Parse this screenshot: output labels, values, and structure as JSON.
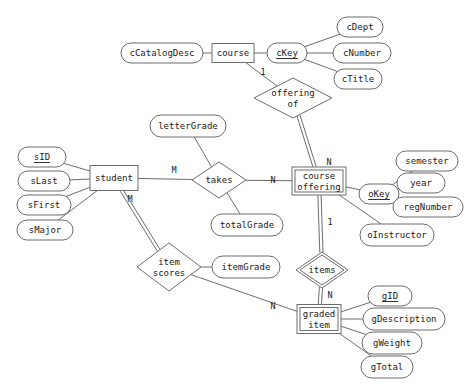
{
  "diagram": {
    "type": "entity-relationship-diagram",
    "background_color": "#ffffff",
    "line_color": "#6d6d6d",
    "text_color": "#1a1a1a"
  },
  "entities": [
    {
      "id": "course",
      "label": "course",
      "kind": "strong",
      "x": 233,
      "y": 53,
      "w": 42,
      "h": 19
    },
    {
      "id": "student",
      "label": "student",
      "kind": "strong",
      "x": 114,
      "y": 178,
      "w": 48,
      "h": 25
    },
    {
      "id": "course_offering",
      "label_line1": "course",
      "label_line2": "offering",
      "kind": "weak",
      "x": 319,
      "y": 181,
      "w": 54,
      "h": 28
    },
    {
      "id": "graded_item",
      "label_line1": "graded",
      "label_line2": "item",
      "kind": "weak",
      "x": 319,
      "y": 319,
      "w": 44,
      "h": 29
    }
  ],
  "relationships": [
    {
      "id": "offering_of",
      "label_line1": "offering",
      "label_line2": "of",
      "kind": "normal",
      "x": 293,
      "y": 98,
      "rx": 39,
      "ry": 20
    },
    {
      "id": "takes",
      "label": "takes",
      "kind": "normal",
      "x": 219,
      "y": 180,
      "rx": 27,
      "ry": 18
    },
    {
      "id": "item_scores",
      "label_line1": "item",
      "label_line2": "scores",
      "kind": "normal",
      "x": 169,
      "y": 267,
      "rx": 32,
      "ry": 24
    },
    {
      "id": "items",
      "label": "items",
      "kind": "identifying",
      "x": 322,
      "y": 270,
      "rx": 26,
      "ry": 18
    }
  ],
  "attributes": [
    {
      "id": "cCatalogDesc",
      "label": "cCatalogDesc",
      "key": false,
      "owner": "course",
      "x": 162,
      "y": 53,
      "rx": 41,
      "ry": 10
    },
    {
      "id": "cKey",
      "label": "cKey",
      "key": true,
      "owner": "course",
      "x": 287,
      "y": 53,
      "rx": 20,
      "ry": 10
    },
    {
      "id": "cDept",
      "label": "cDept",
      "key": false,
      "owner": "cKey",
      "x": 360,
      "y": 27,
      "rx": 23,
      "ry": 10
    },
    {
      "id": "cNumber",
      "label": "cNumber",
      "key": false,
      "owner": "cKey",
      "x": 362,
      "y": 53,
      "rx": 29,
      "ry": 10
    },
    {
      "id": "cTitle",
      "label": "cTitle",
      "key": false,
      "owner": "cKey",
      "x": 358,
      "y": 79,
      "rx": 24,
      "ry": 10
    },
    {
      "id": "sID",
      "label": "sID",
      "key": true,
      "owner": "student",
      "x": 42,
      "y": 157,
      "rx": 24,
      "ry": 10
    },
    {
      "id": "sLast",
      "label": "sLast",
      "key": false,
      "owner": "student",
      "x": 44,
      "y": 181,
      "rx": 26,
      "ry": 10
    },
    {
      "id": "sFirst",
      "label": "sFirst",
      "key": false,
      "owner": "student",
      "x": 44,
      "y": 205,
      "rx": 27,
      "ry": 10
    },
    {
      "id": "sMajor",
      "label": "sMajor",
      "key": false,
      "owner": "student",
      "x": 45,
      "y": 230,
      "rx": 28,
      "ry": 10
    },
    {
      "id": "letterGrade",
      "label": "letterGrade",
      "key": false,
      "owner": "takes",
      "x": 188,
      "y": 126,
      "rx": 38,
      "ry": 11
    },
    {
      "id": "totalGrade",
      "label": "totalGrade",
      "key": false,
      "owner": "takes",
      "x": 247,
      "y": 225,
      "rx": 36,
      "ry": 11
    },
    {
      "id": "okey",
      "label": "oKey",
      "key": true,
      "owner": "course_offering",
      "x": 379,
      "y": 194,
      "rx": 20,
      "ry": 10
    },
    {
      "id": "semester",
      "label": "semester",
      "key": false,
      "owner": "okey",
      "x": 427,
      "y": 161,
      "rx": 31,
      "ry": 10
    },
    {
      "id": "year",
      "label": "year",
      "key": false,
      "owner": "okey",
      "x": 421,
      "y": 183,
      "rx": 24,
      "ry": 10
    },
    {
      "id": "regNumber",
      "label": "regNumber",
      "key": false,
      "owner": "okey",
      "x": 428,
      "y": 207,
      "rx": 35,
      "ry": 10
    },
    {
      "id": "oInstructor",
      "label": "oInstructor",
      "key": false,
      "owner": "course_offering",
      "x": 397,
      "y": 235,
      "rx": 37,
      "ry": 11
    },
    {
      "id": "itemGrade",
      "label": "itemGrade",
      "key": false,
      "owner": "item_scores",
      "x": 246,
      "y": 267,
      "rx": 34,
      "ry": 11
    },
    {
      "id": "gID",
      "label": "gID",
      "key": true,
      "owner": "graded_item",
      "x": 390,
      "y": 296,
      "rx": 22,
      "ry": 10
    },
    {
      "id": "gDescription",
      "label": "gDescription",
      "key": false,
      "owner": "graded_item",
      "x": 404,
      "y": 319,
      "rx": 41,
      "ry": 11
    },
    {
      "id": "gWeight",
      "label": "gWeight",
      "key": false,
      "owner": "graded_item",
      "x": 392,
      "y": 343,
      "rx": 30,
      "ry": 11
    },
    {
      "id": "gTotal",
      "label": "gTotal",
      "key": false,
      "owner": "graded_item",
      "x": 387,
      "y": 367,
      "rx": 26,
      "ry": 11
    }
  ],
  "cardinalities": [
    {
      "id": "card-course-offeringof",
      "value": "1",
      "x": 263,
      "y": 72
    },
    {
      "id": "card-offeringof-offering",
      "value": "N",
      "x": 329,
      "y": 162
    },
    {
      "id": "card-student-takes",
      "value": "M",
      "x": 174,
      "y": 170
    },
    {
      "id": "card-takes-offering",
      "value": "N",
      "x": 273,
      "y": 180
    },
    {
      "id": "card-student-itemscores",
      "value": "M",
      "x": 130,
      "y": 199
    },
    {
      "id": "card-offering-items",
      "value": "1",
      "x": 330,
      "y": 222
    },
    {
      "id": "card-items-graded",
      "value": "N",
      "x": 330,
      "y": 295
    },
    {
      "id": "card-itemscores-graded",
      "value": "N",
      "x": 273,
      "y": 306
    }
  ],
  "edges": [
    {
      "from": "cCatalogDesc",
      "to": "course",
      "style": "single"
    },
    {
      "from": "course",
      "to": "cKey",
      "style": "single"
    },
    {
      "from": "cKey",
      "to": "cDept",
      "style": "single"
    },
    {
      "from": "cKey",
      "to": "cNumber",
      "style": "single"
    },
    {
      "from": "cKey",
      "to": "cTitle",
      "style": "single"
    },
    {
      "from": "course",
      "to": "offering_of",
      "style": "single"
    },
    {
      "from": "offering_of",
      "to": "course_offering",
      "style": "double"
    },
    {
      "from": "sID",
      "to": "student",
      "style": "single"
    },
    {
      "from": "sLast",
      "to": "student",
      "style": "single"
    },
    {
      "from": "sFirst",
      "to": "student",
      "style": "single"
    },
    {
      "from": "sMajor",
      "to": "student",
      "style": "single"
    },
    {
      "from": "student",
      "to": "takes",
      "style": "single"
    },
    {
      "from": "takes",
      "to": "course_offering",
      "style": "single"
    },
    {
      "from": "letterGrade",
      "to": "takes",
      "style": "single"
    },
    {
      "from": "takes",
      "to": "totalGrade",
      "style": "single"
    },
    {
      "from": "course_offering",
      "to": "okey",
      "style": "single"
    },
    {
      "from": "okey",
      "to": "semester",
      "style": "single"
    },
    {
      "from": "okey",
      "to": "year",
      "style": "single"
    },
    {
      "from": "okey",
      "to": "regNumber",
      "style": "single"
    },
    {
      "from": "course_offering",
      "to": "oInstructor",
      "style": "single"
    },
    {
      "from": "course_offering",
      "to": "items",
      "style": "double"
    },
    {
      "from": "items",
      "to": "graded_item",
      "style": "double"
    },
    {
      "from": "student",
      "to": "item_scores",
      "style": "double"
    },
    {
      "from": "item_scores",
      "to": "itemGrade",
      "style": "single"
    },
    {
      "from": "item_scores",
      "to": "graded_item",
      "style": "single"
    },
    {
      "from": "graded_item",
      "to": "gID",
      "style": "single"
    },
    {
      "from": "graded_item",
      "to": "gDescription",
      "style": "single"
    },
    {
      "from": "graded_item",
      "to": "gWeight",
      "style": "single"
    },
    {
      "from": "graded_item",
      "to": "gTotal",
      "style": "single"
    }
  ]
}
